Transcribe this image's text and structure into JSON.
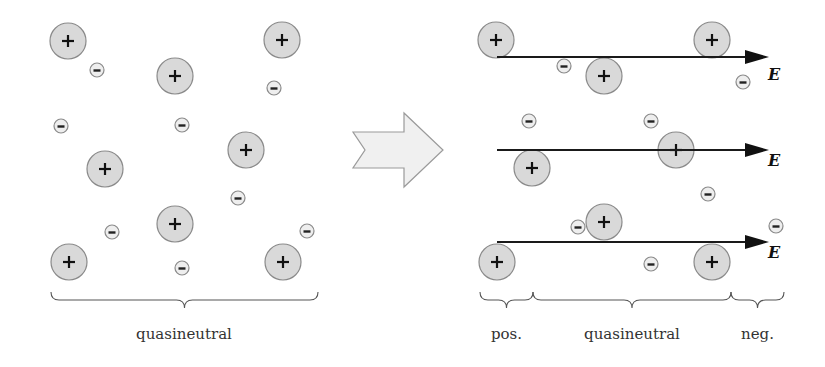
{
  "diagram": {
    "colors": {
      "ion_fill": "#d9d9d9",
      "ion_stroke": "#8a8a8a",
      "electron_fill": "#eeeeee",
      "field_line": "#1a1a1a",
      "transition_arrow_fill": "#f0f0f0"
    },
    "icons": {
      "ion": "plus-circle-icon",
      "electron": "minus-circle-icon",
      "transition": "right-chevron-arrow-icon",
      "field": "right-arrow-icon"
    },
    "left_panel": {
      "label": "quasineutral",
      "ions": [
        {
          "x": 68,
          "y": 41
        },
        {
          "x": 282,
          "y": 40
        },
        {
          "x": 175,
          "y": 76
        },
        {
          "x": 246,
          "y": 150
        },
        {
          "x": 105,
          "y": 169
        },
        {
          "x": 175,
          "y": 224
        },
        {
          "x": 69,
          "y": 262
        },
        {
          "x": 283,
          "y": 262
        }
      ],
      "electrons": [
        {
          "x": 97,
          "y": 70
        },
        {
          "x": 274,
          "y": 88
        },
        {
          "x": 61,
          "y": 126
        },
        {
          "x": 182,
          "y": 125
        },
        {
          "x": 238,
          "y": 198
        },
        {
          "x": 112,
          "y": 232
        },
        {
          "x": 307,
          "y": 231
        },
        {
          "x": 182,
          "y": 268
        }
      ],
      "brace": {
        "x1": 51,
        "x2": 318,
        "y": 300
      }
    },
    "transition_arrow": {
      "label": ""
    },
    "right_panel": {
      "field_label": "E",
      "field_lines": [
        {
          "y": 57,
          "x1": 497,
          "x2": 765,
          "label_y": 80
        },
        {
          "y": 150,
          "x1": 497,
          "x2": 765,
          "label_y": 166
        },
        {
          "y": 242,
          "x1": 497,
          "x2": 765,
          "label_y": 258
        }
      ],
      "ions": [
        {
          "x": 496,
          "y": 40
        },
        {
          "x": 712,
          "y": 40
        },
        {
          "x": 604,
          "y": 76
        },
        {
          "x": 532,
          "y": 168
        },
        {
          "x": 676,
          "y": 150
        },
        {
          "x": 604,
          "y": 222
        },
        {
          "x": 497,
          "y": 262
        },
        {
          "x": 712,
          "y": 262
        }
      ],
      "electrons": [
        {
          "x": 564,
          "y": 66
        },
        {
          "x": 743,
          "y": 82
        },
        {
          "x": 529,
          "y": 121
        },
        {
          "x": 651,
          "y": 121
        },
        {
          "x": 708,
          "y": 194
        },
        {
          "x": 578,
          "y": 227
        },
        {
          "x": 776,
          "y": 226
        },
        {
          "x": 651,
          "y": 264
        }
      ],
      "regions": [
        {
          "label": "pos.",
          "x1": 480,
          "x2": 533
        },
        {
          "label": "quasineutral",
          "x1": 533,
          "x2": 731
        },
        {
          "label": "neg.",
          "x1": 731,
          "x2": 784
        }
      ],
      "brace_y": 300
    }
  }
}
